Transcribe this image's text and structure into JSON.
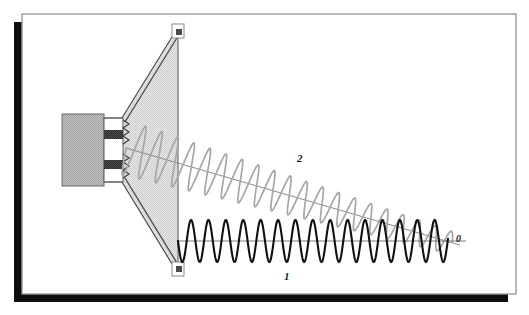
{
  "figure": {
    "kind": "horn-antenna-ray-diagram",
    "background": "#ffffff",
    "frame": {
      "border_color": "#9a9a9a",
      "shadow_color": "#0d0d0d",
      "x": 22,
      "y": 14,
      "width": 494,
      "height": 280,
      "shadow_dx": -8,
      "shadow_dy": 8
    },
    "labels": [
      {
        "id": "ray1",
        "text": "1",
        "x": 284,
        "y": 270,
        "style": "bold-italic"
      },
      {
        "id": "ray2",
        "text": "2",
        "x": 297,
        "y": 152,
        "style": "bold-italic"
      },
      {
        "id": "observation",
        "text": "0",
        "x": 456,
        "y": 233,
        "style": "bold-italic"
      }
    ],
    "colors": {
      "wave_direct": "#111111",
      "wave_diffracted": "#a6a6a6",
      "horn_fill": "#dcdcdc",
      "feed_fill": "#b4b4b4",
      "conductor": "#3a3a3a",
      "outline": "#555555",
      "axis_line": "#666666",
      "terminal_fill": "#4a4a4a"
    },
    "waveguide_feed": {
      "block": {
        "x": 62,
        "y": 114,
        "width": 42,
        "height": 72
      },
      "throat": {
        "x": 104,
        "y": 120,
        "width": 18,
        "height": 60
      },
      "conductors": [
        {
          "x": 104,
          "y": 131,
          "width": 18,
          "height": 8
        },
        {
          "x": 104,
          "y": 161,
          "width": 18,
          "height": 8
        }
      ]
    },
    "horn": {
      "apex_top": {
        "x": 122,
        "y": 120
      },
      "apex_bottom": {
        "x": 122,
        "y": 180
      },
      "aperture_x": 178,
      "aperture_top_y": 30,
      "aperture_bottom_y": 271,
      "wall_thickness": 3
    },
    "terminals": [
      {
        "id": "edge-top",
        "x": 174,
        "y": 28,
        "size": 9
      },
      {
        "id": "edge-bottom",
        "x": 174,
        "y": 264,
        "size": 9
      }
    ],
    "ray_direct": {
      "id": "ray-1",
      "description": "direct ray along horn axis to observation point",
      "start": {
        "x": 178,
        "y": 241
      },
      "end": {
        "x": 448,
        "y": 241
      },
      "amplitude": 21,
      "wavelength": 17.4,
      "color": "#111111",
      "stroke_width": 2.1
    },
    "ray_diffracted": {
      "id": "ray-2",
      "description": "edge-diffracted ray descending to observation point",
      "start": {
        "x": 126,
        "y": 148
      },
      "end": {
        "x": 452,
        "y": 243
      },
      "amplitude_start": 27,
      "amplitude_end": 11,
      "wavelength": 17.0,
      "color": "#a6a6a6",
      "stroke_width": 1.7
    },
    "axis_direct": {
      "x1": 178,
      "y1": 241,
      "x2": 462,
      "y2": 241
    },
    "axis_diffracted": {
      "x1": 126,
      "y1": 148,
      "x2": 460,
      "y2": 245
    }
  }
}
